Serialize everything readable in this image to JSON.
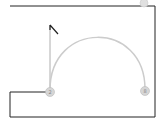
{
  "canvas": {
    "width": 161,
    "height": 121,
    "background": "#ffffff"
  },
  "frame": {
    "stroke": "#222222"
  },
  "arc": {
    "stroke": "#cccccc"
  },
  "nodes": [
    {
      "id": "node-left",
      "label": "2",
      "cx": 50,
      "cy": 92
    },
    {
      "id": "node-right",
      "label": "8",
      "cx": 145,
      "cy": 91
    },
    {
      "id": "node-top",
      "label": "",
      "cx": 144,
      "cy": 4
    }
  ],
  "colors": {
    "node_fill": "#d6d6d6",
    "node_stroke": "#bbbbbb",
    "line": "#222222",
    "pointer": "#333333"
  }
}
